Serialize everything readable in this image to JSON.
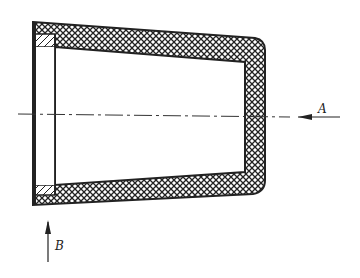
{
  "figure": {
    "type": "engineering-section-drawing",
    "views": {
      "arrow_a": {
        "label": "A",
        "direction": "left",
        "position": "right side on centerline"
      },
      "arrow_b": {
        "label": "B",
        "direction": "up",
        "position": "bottom left"
      }
    },
    "features": {
      "centerline": "dash-dot horizontal axis",
      "hatching": "cross-hatch (section)",
      "flange_hatch": "single diagonal hatch at open end"
    },
    "colors": {
      "line": "#222222",
      "background": "#ffffff"
    }
  }
}
